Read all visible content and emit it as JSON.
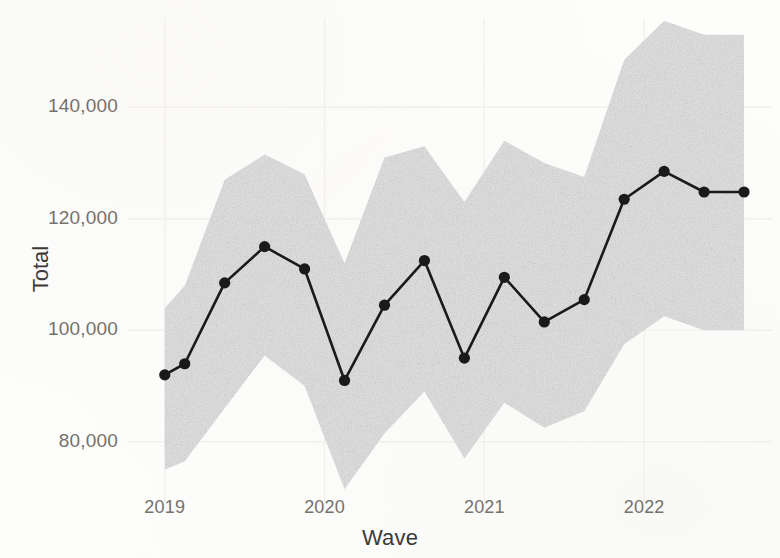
{
  "chart_data": {
    "type": "line",
    "title": "",
    "subtitle": "",
    "xlabel": "Wave",
    "ylabel": "Total",
    "grid": true,
    "legend": false,
    "legend_position": "none",
    "xlim": [
      2018.82,
      2022.8
    ],
    "ylim": [
      71000,
      156000
    ],
    "x_tick_labels": [
      "2019",
      "2020",
      "2021",
      "2022"
    ],
    "x_tick_values": [
      2019,
      2020,
      2021,
      2022
    ],
    "y_tick_labels": [
      "80,000",
      "100,000",
      "120,000",
      "140,000"
    ],
    "y_tick_values": [
      80000,
      100000,
      120000,
      140000
    ],
    "x": [
      2019.0,
      2019.125,
      2019.375,
      2019.625,
      2019.875,
      2020.125,
      2020.375,
      2020.625,
      2020.875,
      2021.125,
      2021.375,
      2021.625,
      2021.875,
      2022.125,
      2022.375,
      2022.625
    ],
    "series": [
      {
        "name": "Total",
        "marker": "circle",
        "color": "#1a1a1a",
        "values": [
          92000,
          94000,
          108500,
          115000,
          111000,
          91000,
          104500,
          112500,
          95000,
          109500,
          101500,
          105500,
          123500,
          128500,
          124800,
          124800
        ]
      }
    ],
    "band": {
      "name": "confidence interval",
      "color": "#e3e3e3",
      "upper": [
        104000,
        108000,
        127000,
        131500,
        128000,
        112000,
        131000,
        133000,
        123000,
        134000,
        130000,
        127500,
        148500,
        155500,
        153000,
        153000
      ],
      "lower": [
        75000,
        76500,
        86000,
        95500,
        90000,
        71500,
        81500,
        89000,
        77000,
        87000,
        82500,
        85500,
        97500,
        102500,
        100000,
        100000
      ]
    },
    "values_readable": [
      {
        "wave": "2019 Q1",
        "total": 92000
      },
      {
        "wave": "2019 Q2",
        "total": 94000
      },
      {
        "wave": "2019 Q3",
        "total": 108500
      },
      {
        "wave": "2019 Q4",
        "total": 115000
      },
      {
        "wave": "2020 Q1",
        "total": 111000
      },
      {
        "wave": "2020 Q2",
        "total": 91000
      },
      {
        "wave": "2020 Q3",
        "total": 104500
      },
      {
        "wave": "2020 Q4",
        "total": 112500
      },
      {
        "wave": "2021 Q1",
        "total": 95000
      },
      {
        "wave": "2021 Q2",
        "total": 109500
      },
      {
        "wave": "2021 Q3",
        "total": 101500
      },
      {
        "wave": "2021 Q4",
        "total": 105500
      },
      {
        "wave": "2022 Q1",
        "total": 123500
      },
      {
        "wave": "2022 Q2",
        "total": 128500
      },
      {
        "wave": "2022 Q3",
        "total": 124800
      }
    ]
  },
  "style": {
    "background": "#fdfdfc",
    "band_color": "#e3e3e3",
    "line_color": "#1a1a1a",
    "grid_color": "#f2f0ee",
    "tick_text_color": "#75716d",
    "axis_title_color": "#3c3a38"
  }
}
